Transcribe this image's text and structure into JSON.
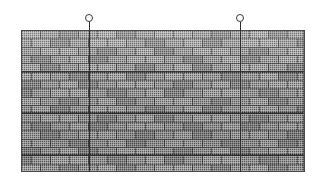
{
  "figure": {
    "background_color": "#ffffff",
    "width": 323,
    "height": 185
  },
  "panel": {
    "name": "brick-wall-panel",
    "x": 21,
    "y": 30,
    "width": 284,
    "height": 142,
    "fill_color": "#9a9a9a",
    "border_color": "#5b5b5b",
    "bond": "running bond",
    "course_count": 17,
    "course_height": 8.35,
    "brick_width": 19,
    "mortar_color": "#4f4f4f",
    "texture": "stippled halftone"
  },
  "emphasis_courses": [
    4,
    9,
    14
  ],
  "wires": [
    {
      "name": "suspension-wire-left",
      "x": 89,
      "top": 22,
      "bottom": 172,
      "color": "#2e2e2e"
    },
    {
      "name": "suspension-wire-right",
      "x": 240,
      "top": 22,
      "bottom": 172,
      "color": "#2e2e2e"
    }
  ],
  "eyes": [
    {
      "name": "suspension-eye-left",
      "cx": 89,
      "cy": 18,
      "r": 4,
      "stroke": "#3a3a3a",
      "fill": "#ffffff"
    },
    {
      "name": "suspension-eye-right",
      "cx": 240,
      "cy": 18,
      "r": 4,
      "stroke": "#3a3a3a",
      "fill": "#ffffff"
    }
  ]
}
